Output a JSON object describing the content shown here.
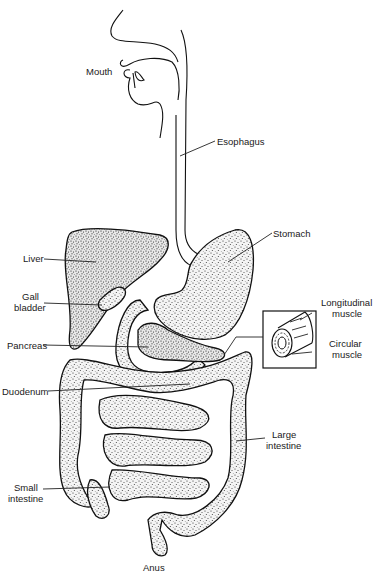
{
  "diagram": {
    "labels": {
      "mouth": "Mouth",
      "esophagus": "Esophagus",
      "stomach": "Stomach",
      "liver": "Liver",
      "gall_bladder_line1": "Gall",
      "gall_bladder_line2": "bladder",
      "longitudinal_muscle_line1": "Longitudinal",
      "longitudinal_muscle_line2": "muscle",
      "circular_muscle_line1": "Circular",
      "circular_muscle_line2": "muscle",
      "pancreas": "Pancreas",
      "duodenum": "Duodenum",
      "large_intestine_line1": "Large",
      "large_intestine_line2": "intestine",
      "small_intestine_line1": "Small",
      "small_intestine_line2": "intestine",
      "anus": "Anus"
    },
    "colors": {
      "ink": "#111111",
      "background": "#ffffff"
    }
  }
}
